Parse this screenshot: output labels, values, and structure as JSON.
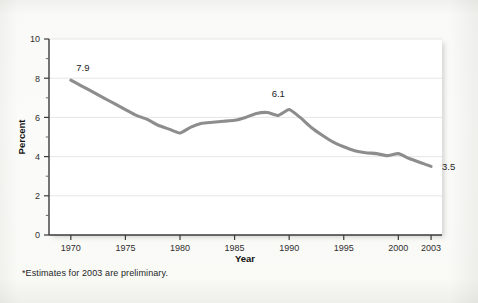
{
  "chart_data": {
    "type": "line",
    "title": "",
    "xlabel": "Year",
    "ylabel": "Percent",
    "xlim": [
      1968,
      2004
    ],
    "ylim": [
      0,
      10
    ],
    "grid": "horizontal",
    "legend": "none",
    "line_color": "#8d8d8d",
    "x_ticks": [
      1970,
      1975,
      1980,
      1985,
      1990,
      1995,
      2000,
      2003
    ],
    "x_tick_labels": [
      "1970",
      "1975",
      "1980",
      "1985",
      "1990",
      "1995",
      "2000",
      "2003"
    ],
    "y_ticks": [
      0,
      2,
      4,
      6,
      8,
      10
    ],
    "y_tick_labels": [
      "0",
      "2",
      "4",
      "6",
      "8",
      "10"
    ],
    "y_minor_ticks": [
      1,
      3,
      5,
      7,
      9
    ],
    "series": [
      {
        "name": "Percent",
        "x": [
          1970,
          1971,
          1972,
          1973,
          1974,
          1975,
          1976,
          1977,
          1978,
          1979,
          1980,
          1981,
          1982,
          1983,
          1984,
          1985,
          1986,
          1987,
          1988,
          1989,
          1990,
          1991,
          1992,
          1993,
          1994,
          1995,
          1996,
          1997,
          1998,
          1999,
          2000,
          2001,
          2002,
          2003
        ],
        "values": [
          7.9,
          7.6,
          7.3,
          7.0,
          6.7,
          6.4,
          6.1,
          5.9,
          5.6,
          5.4,
          5.2,
          5.5,
          5.7,
          5.75,
          5.8,
          5.85,
          6.0,
          6.2,
          6.25,
          6.1,
          6.4,
          6.0,
          5.5,
          5.1,
          4.75,
          4.5,
          4.3,
          4.2,
          4.15,
          4.05,
          4.15,
          3.9,
          3.7,
          3.5
        ]
      }
    ],
    "point_labels": [
      {
        "label": "7.9",
        "x": 1970,
        "y": 7.9,
        "anchor": "above-right"
      },
      {
        "label": "6.1",
        "x": 1989,
        "y": 6.55,
        "anchor": "above"
      },
      {
        "label": "3.5",
        "x": 2003,
        "y": 3.5,
        "anchor": "right"
      }
    ]
  },
  "footnote": "*Estimates for 2003 are preliminary."
}
